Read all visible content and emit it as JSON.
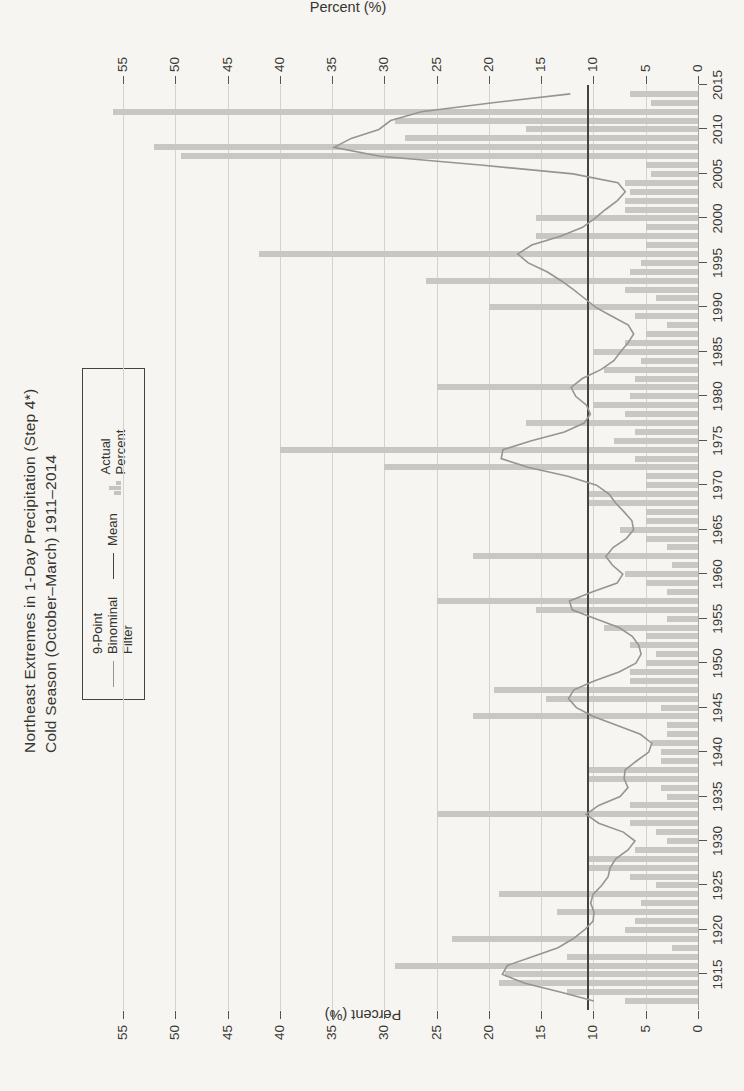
{
  "page": {
    "background": "#f6f5f1",
    "kind": "scanned book figure, chart rotated 90 degrees on page"
  },
  "title": {
    "line1": "Northeast Extremes in 1-Day Precipitation (Step 4*)",
    "line2": "Cold Season (October–March) 1911–2014"
  },
  "axis_labels": {
    "left": "Percent (%)",
    "right": "Percent (%)"
  },
  "legend": {
    "filter_label": "9-Point\nBinominal\nFilter",
    "mean_label": "Mean",
    "actual_label": "Actual\nPercent"
  },
  "colors": {
    "bar": "#c8c7c3",
    "filter_line": "#96958f",
    "mean_line": "#45433d",
    "grid": "#d3d2cd",
    "text": "#35342f",
    "paper": "#f6f5f1"
  },
  "chart_data": {
    "type": "bar",
    "orientation_on_page": "rotated 90deg counterclockwise",
    "xlabel": "",
    "ylabel": "Percent (%)",
    "ylim": [
      0,
      55
    ],
    "yticks": [
      0,
      5,
      10,
      15,
      20,
      25,
      30,
      35,
      40,
      45,
      50,
      55
    ],
    "xlim": [
      1911,
      2015
    ],
    "xticks": [
      1915,
      1920,
      1925,
      1930,
      1935,
      1940,
      1945,
      1950,
      1955,
      1960,
      1965,
      1970,
      1975,
      1980,
      1985,
      1990,
      1995,
      2000,
      2005,
      2010,
      2015
    ],
    "grid": "horizontal",
    "legend_position": "top, boxed, outside plot",
    "mean_value": 10.5,
    "smoothing": "9-point binomial filter of annual values",
    "categories": [
      1912,
      1913,
      1914,
      1915,
      1916,
      1917,
      1918,
      1919,
      1920,
      1921,
      1922,
      1923,
      1924,
      1925,
      1926,
      1927,
      1928,
      1929,
      1930,
      1931,
      1932,
      1933,
      1934,
      1935,
      1936,
      1937,
      1938,
      1939,
      1940,
      1941,
      1942,
      1943,
      1944,
      1945,
      1946,
      1947,
      1948,
      1949,
      1950,
      1951,
      1952,
      1953,
      1954,
      1955,
      1956,
      1957,
      1958,
      1959,
      1960,
      1961,
      1962,
      1963,
      1964,
      1965,
      1966,
      1967,
      1968,
      1969,
      1970,
      1971,
      1972,
      1973,
      1974,
      1975,
      1976,
      1977,
      1978,
      1979,
      1980,
      1981,
      1982,
      1983,
      1984,
      1985,
      1986,
      1987,
      1988,
      1989,
      1990,
      1991,
      1992,
      1993,
      1994,
      1995,
      1996,
      1997,
      1998,
      1999,
      2000,
      2001,
      2002,
      2003,
      2004,
      2005,
      2006,
      2007,
      2008,
      2009,
      2010,
      2011,
      2012,
      2013,
      2014
    ],
    "series": [
      {
        "name": "Actual Percent",
        "style": "bar",
        "values": [
          7,
          12.5,
          19,
          18.5,
          29,
          12.5,
          2.5,
          23.5,
          7,
          6,
          13.5,
          5.5,
          19,
          4,
          6.5,
          10.5,
          10.5,
          6,
          3,
          4,
          6.5,
          25,
          6.5,
          3,
          3.5,
          10.5,
          10.5,
          3.5,
          3.5,
          4.5,
          3,
          3,
          21.5,
          3.5,
          14.5,
          19.5,
          6.5,
          6.5,
          5,
          4,
          6.5,
          5,
          9,
          3,
          15.5,
          25,
          3,
          5,
          7,
          2.5,
          21.5,
          3,
          5,
          7.5,
          5,
          5,
          10.5,
          10.5,
          5,
          5,
          30,
          6,
          40,
          8,
          6,
          16.5,
          7,
          10,
          6.5,
          25,
          6,
          9,
          5.5,
          10,
          7,
          5,
          3,
          6,
          20,
          4,
          7,
          26,
          6.5,
          5.5,
          42,
          5,
          15.5,
          5,
          15.5,
          7,
          7,
          6.5,
          7,
          4.5,
          5,
          49.5,
          52,
          28,
          16.5,
          29,
          56,
          4.5,
          6.5
        ]
      },
      {
        "name": "Mean",
        "style": "horizontal-line",
        "value": 10.5
      },
      {
        "name": "9-Point Binominal Filter",
        "style": "line",
        "computed_from": "Actual Percent"
      }
    ]
  }
}
